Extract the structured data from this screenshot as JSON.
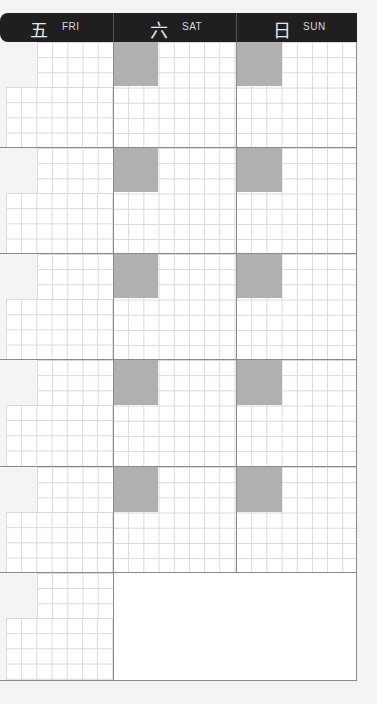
{
  "header": {
    "days": [
      {
        "kanji": "五",
        "label": "FRI"
      },
      {
        "kanji": "六",
        "label": "SAT"
      },
      {
        "kanji": "日",
        "label": "SUN"
      }
    ]
  },
  "layout": {
    "rows": 6,
    "weekend_blocks_per_row": 5,
    "last_row_merged_weekend": true
  },
  "colors": {
    "header_bg": "#1f1f1f",
    "block_grey": "#b0b0b0",
    "grid_line": "#d9d9d9",
    "divider": "#8a8a8a"
  }
}
